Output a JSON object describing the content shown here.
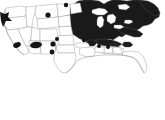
{
  "figure": {
    "title": "United States distribution map",
    "type": "map",
    "region": "Contiguous United States",
    "background_color": "#ffffff",
    "width_px": 165,
    "height_px": 120
  },
  "legend": {
    "present": false,
    "items": []
  },
  "map_data": {
    "type": "choropleth",
    "projection": "albers-usa",
    "fill_colors": {
      "filled": "#1a1a1a",
      "unfilled": "#ffffff",
      "border": "#9a9a9a",
      "marker": "#151515"
    },
    "filled_region_description": "Eastern and Midwestern United States shaded solid dark",
    "filled_states": [
      "Minnesota",
      "Wisconsin",
      "Michigan",
      "Iowa",
      "Illinois",
      "Indiana",
      "Ohio",
      "Pennsylvania",
      "New York",
      "Vermont",
      "New Hampshire",
      "Maine",
      "Massachusetts",
      "Connecticut",
      "Rhode Island",
      "New Jersey",
      "Delaware",
      "Maryland",
      "West Virginia",
      "Virginia",
      "Kentucky",
      "Tennessee",
      "North Carolina",
      "Missouri",
      "Arkansas",
      "Mississippi",
      "Alabama",
      "Georgia",
      "South Carolina",
      "Louisiana"
    ],
    "unfilled_states": [
      "Washington",
      "Oregon",
      "California",
      "Nevada",
      "Idaho",
      "Montana",
      "Wyoming",
      "Utah",
      "Arizona",
      "Colorado",
      "New Mexico",
      "North Dakota",
      "South Dakota",
      "Nebraska",
      "Kansas",
      "Oklahoma",
      "Texas",
      "Florida"
    ],
    "markers": [
      {
        "label": "marker-washington-coast",
        "state": "Washington",
        "shape": "irregular-blob"
      },
      {
        "label": "marker-northern-california",
        "state": "California",
        "shape": "ellipse"
      },
      {
        "label": "marker-nevada-utah",
        "state": "Nevada",
        "shape": "ellipse"
      },
      {
        "label": "marker-arizona",
        "state": "Arizona",
        "shape": "ellipse"
      },
      {
        "label": "marker-new-mexico",
        "state": "New Mexico",
        "shape": "dot"
      },
      {
        "label": "marker-montana",
        "state": "Montana",
        "shape": "dot"
      },
      {
        "label": "marker-north-dakota",
        "state": "North Dakota",
        "shape": "dot"
      },
      {
        "label": "marker-colorado",
        "state": "Colorado",
        "shape": "dot"
      },
      {
        "label": "marker-texas-panhandle",
        "state": "Texas",
        "shape": "dot"
      },
      {
        "label": "marker-kansas",
        "state": "Kansas",
        "shape": "dot"
      },
      {
        "label": "marker-oklahoma",
        "state": "Oklahoma",
        "shape": "dot"
      }
    ],
    "great_lakes": [
      "Lake Superior",
      "Lake Michigan",
      "Lake Huron",
      "Lake Erie",
      "Lake Ontario"
    ]
  }
}
